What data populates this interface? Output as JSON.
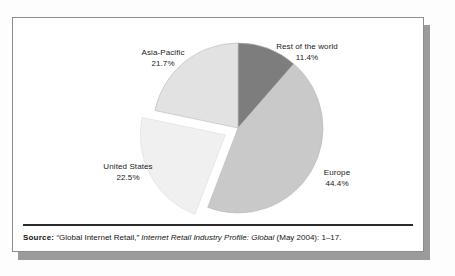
{
  "figure": {
    "source_note": {
      "label": "Source:",
      "citation_quoted": "“Global Internet Retail,”",
      "publication": "Internet Retail Industry Profile: Global",
      "date_and_pages": "(May 2004): 1–17."
    }
  },
  "chart_data": {
    "type": "pie",
    "title": "",
    "subtitle": "",
    "xlabel": "",
    "ylabel": "",
    "legend_position": "none",
    "labels_position": "outside-callout",
    "grid": false,
    "start_angle_deg": 0,
    "direction": "clockwise",
    "categories": [
      "Rest of the world",
      "Europe",
      "United States",
      "Asia-Pacific"
    ],
    "values": [
      11.4,
      44.4,
      22.5,
      21.7
    ],
    "value_suffix": "%",
    "total": 100.0,
    "colors": [
      "#7d7d7d",
      "#c9c9c9",
      "#f0f0f0",
      "#e2e2e2"
    ],
    "exploded": [
      "United States"
    ],
    "slices": [
      {
        "name": "Rest of the world",
        "value": 11.4,
        "value_label": "11.4%",
        "color": "#7d7d7d",
        "exploded": false
      },
      {
        "name": "Europe",
        "value": 44.4,
        "value_label": "44.4%",
        "color": "#c9c9c9",
        "exploded": false
      },
      {
        "name": "United States",
        "value": 22.5,
        "value_label": "22.5%",
        "color": "#f0f0f0",
        "exploded": true
      },
      {
        "name": "Asia-Pacific",
        "value": 21.7,
        "value_label": "21.7%",
        "color": "#e2e2e2",
        "exploded": false
      }
    ]
  }
}
